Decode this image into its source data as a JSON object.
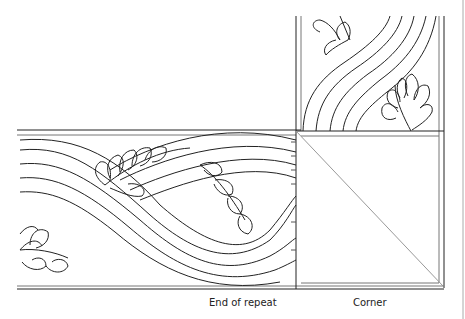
{
  "labels": {
    "end_of_repeat": "End of repeat",
    "corner": "Corner"
  },
  "colors": {
    "line": "#222222",
    "thin_line": "#888888",
    "background": "#ffffff"
  },
  "diagram": {
    "sections": [
      "horizontal-border-repeat",
      "vertical-border-repeat",
      "corner-square"
    ]
  }
}
